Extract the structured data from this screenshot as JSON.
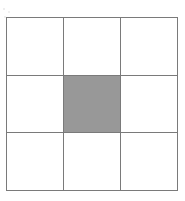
{
  "figure": {
    "canvas": {
      "width_px": 185,
      "height_px": 201,
      "background_color": "#ffffff"
    },
    "grid": {
      "rows": 3,
      "columns": 3,
      "left_px": 6,
      "top_px": 17,
      "width_px": 172,
      "height_px": 174,
      "line_color": "#7a7a7a",
      "outer_line_color": "#6b6b6b",
      "cell_blank_color": "#ffffff",
      "cell_shaded_color": "#9a9a9a",
      "vertical_line_positions_px": [
        6,
        62,
        120,
        178
      ],
      "horizontal_line_positions_px": [
        17,
        76,
        134,
        191
      ]
    },
    "cells": [
      [
        {
          "row": 0,
          "column": 0,
          "state": "blank",
          "label": ""
        },
        {
          "row": 0,
          "column": 1,
          "state": "blank",
          "label": ""
        },
        {
          "row": 0,
          "column": 2,
          "state": "blank",
          "label": ""
        }
      ],
      [
        {
          "row": 1,
          "column": 0,
          "state": "blank",
          "label": ""
        },
        {
          "row": 1,
          "column": 1,
          "state": "shaded",
          "label": ""
        },
        {
          "row": 1,
          "column": 2,
          "state": "blank",
          "label": ""
        }
      ],
      [
        {
          "row": 2,
          "column": 0,
          "state": "blank",
          "label": ""
        },
        {
          "row": 2,
          "column": 1,
          "state": "blank",
          "label": ""
        },
        {
          "row": 2,
          "column": 2,
          "state": "blank",
          "label": ""
        }
      ]
    ]
  }
}
